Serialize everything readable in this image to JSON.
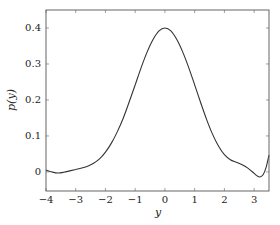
{
  "chart_data": {
    "type": "line",
    "title": "",
    "xlabel": "y",
    "ylabel": "p(y)",
    "xlim": [
      -4,
      3.5
    ],
    "ylim": [
      -0.053,
      0.45
    ],
    "grid": false,
    "legend": null,
    "xticks": [
      -4,
      -3,
      -2,
      -1,
      0,
      1,
      2,
      3
    ],
    "xtick_labels": [
      "−4",
      "−3",
      "−2",
      "−1",
      "0",
      "1",
      "2",
      "3"
    ],
    "yticks": [
      0,
      0.1,
      0.2,
      0.3,
      0.4
    ],
    "ytick_labels": [
      "0",
      "0.1",
      "0.2",
      "0.3",
      "0.4"
    ],
    "series": [
      {
        "name": "p(y)",
        "color": "#333333",
        "x": [
          -4.0,
          -3.8,
          -3.6,
          -3.4,
          -3.2,
          -3.0,
          -2.8,
          -2.6,
          -2.4,
          -2.2,
          -2.0,
          -1.8,
          -1.6,
          -1.4,
          -1.2,
          -1.0,
          -0.8,
          -0.6,
          -0.4,
          -0.2,
          0.0,
          0.2,
          0.4,
          0.6,
          0.8,
          1.0,
          1.2,
          1.4,
          1.6,
          1.8,
          2.0,
          2.2,
          2.4,
          2.6,
          2.8,
          3.0,
          3.1,
          3.2,
          3.3,
          3.4,
          3.5
        ],
        "y": [
          0.005,
          0.0,
          -0.003,
          -0.001,
          0.003,
          0.007,
          0.011,
          0.016,
          0.024,
          0.036,
          0.055,
          0.08,
          0.112,
          0.15,
          0.195,
          0.242,
          0.29,
          0.333,
          0.368,
          0.392,
          0.4,
          0.392,
          0.368,
          0.333,
          0.29,
          0.242,
          0.193,
          0.146,
          0.105,
          0.072,
          0.048,
          0.034,
          0.027,
          0.02,
          0.01,
          -0.004,
          -0.011,
          -0.014,
          -0.008,
          0.012,
          0.047
        ]
      }
    ]
  }
}
